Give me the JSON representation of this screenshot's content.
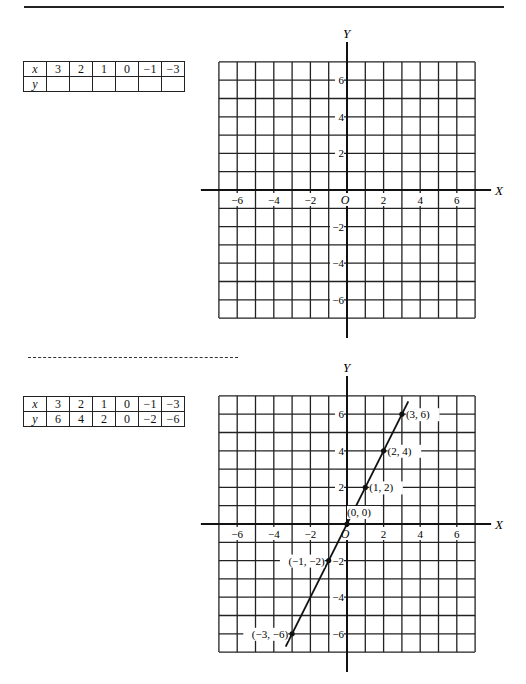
{
  "problem": {
    "table": {
      "x_label": "x",
      "y_label": "y",
      "x_values": [
        "3",
        "2",
        "1",
        "0",
        "−1",
        "−3"
      ],
      "y_values": [
        "",
        "",
        "",
        "",
        "",
        ""
      ]
    },
    "graph": {
      "x_axis_label": "X",
      "y_axis_label": "Y",
      "origin_label": "O",
      "x_ticks": [
        "−6",
        "−4",
        "−2",
        "2",
        "4",
        "6"
      ],
      "y_ticks": [
        "6",
        "4",
        "2",
        "−2",
        "−4",
        "−6"
      ]
    }
  },
  "solution": {
    "table": {
      "x_label": "x",
      "y_label": "y",
      "x_values": [
        "3",
        "2",
        "1",
        "0",
        "−1",
        "−3"
      ],
      "y_values": [
        "6",
        "4",
        "2",
        "0",
        "−2",
        "−6"
      ]
    },
    "graph": {
      "x_axis_label": "X",
      "y_axis_label": "Y",
      "origin_label": "O",
      "x_ticks": [
        "−6",
        "−4",
        "−2",
        "2",
        "4",
        "6"
      ],
      "y_ticks": [
        "6",
        "4",
        "2",
        "−2",
        "−4",
        "−6"
      ],
      "point_labels": [
        "(3, 6)",
        "(2, 4)",
        "(1, 2)",
        "(0, 0)",
        "(−1, −2)",
        "(−3, −6)"
      ]
    }
  },
  "chart_data": [
    {
      "type": "line",
      "title": "",
      "xlabel": "X",
      "ylabel": "Y",
      "xlim": [
        -7,
        7
      ],
      "ylim": [
        -7,
        7
      ],
      "grid": true,
      "series": []
    },
    {
      "type": "line",
      "title": "",
      "xlabel": "X",
      "ylabel": "Y",
      "xlim": [
        -7,
        7
      ],
      "ylim": [
        -7,
        7
      ],
      "grid": true,
      "series": [
        {
          "name": "y = 2x",
          "x": [
            3,
            2,
            1,
            0,
            -1,
            -3
          ],
          "y": [
            6,
            4,
            2,
            0,
            -2,
            -6
          ]
        }
      ]
    }
  ]
}
